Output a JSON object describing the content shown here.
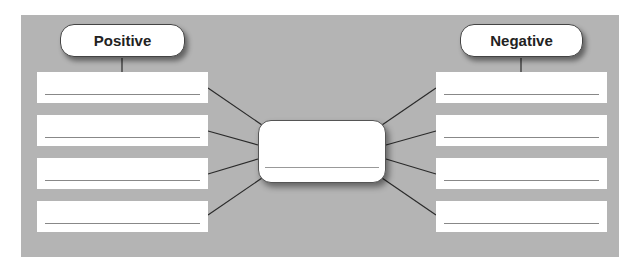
{
  "diagram": {
    "left_header": {
      "label": "Positive"
    },
    "right_header": {
      "label": "Negative"
    },
    "center_box": {
      "text": ""
    },
    "left_boxes": [
      {
        "text": ""
      },
      {
        "text": ""
      },
      {
        "text": ""
      },
      {
        "text": ""
      }
    ],
    "right_boxes": [
      {
        "text": ""
      },
      {
        "text": ""
      },
      {
        "text": ""
      },
      {
        "text": ""
      }
    ],
    "colors": {
      "panel": "#b4b4b4",
      "box": "#ffffff",
      "line": "#333333"
    }
  }
}
